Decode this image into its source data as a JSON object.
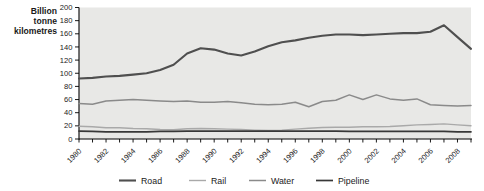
{
  "y_axis_title_lines": [
    "Billion",
    "tonne",
    "kilometres"
  ],
  "chart_data": {
    "type": "line",
    "title": "",
    "ylabel": "Billion tonne kilometres",
    "xlabel": "",
    "x": [
      1980,
      1981,
      1982,
      1983,
      1984,
      1985,
      1986,
      1987,
      1988,
      1989,
      1990,
      1991,
      1992,
      1993,
      1994,
      1995,
      1996,
      1997,
      1998,
      1999,
      2000,
      2001,
      2002,
      2003,
      2004,
      2005,
      2006,
      2007,
      2008,
      2009
    ],
    "x_labeled_ticks": [
      1980,
      1982,
      1984,
      1986,
      1988,
      1990,
      1992,
      1994,
      1996,
      1998,
      2000,
      2002,
      2004,
      2006,
      2008
    ],
    "ylim": [
      0,
      200
    ],
    "ytick_step": 20,
    "grid": false,
    "legend_position": "bottom",
    "plot_bg_color": "#e8e8e6",
    "axis_color": "#000000",
    "label_color": "#1a1a1a",
    "series": [
      {
        "name": "Road",
        "color": "#4f4f4f",
        "stroke_width": 2.1,
        "values": [
          92,
          93,
          95,
          96,
          98,
          100,
          105,
          113,
          130,
          138,
          136,
          130,
          127,
          133,
          141,
          147,
          150,
          154,
          157,
          159,
          159,
          158,
          159,
          160,
          161,
          161,
          163,
          173,
          155,
          137
        ]
      },
      {
        "name": "Rail",
        "color": "#a9a9a9",
        "stroke_width": 1.4,
        "values": [
          19.5,
          18.5,
          17,
          17,
          16,
          15.5,
          14.5,
          14,
          15.5,
          16,
          15.5,
          15,
          14.5,
          13.5,
          13,
          13.5,
          15,
          16.5,
          17.5,
          18,
          18,
          18.5,
          18.5,
          19,
          20,
          21.5,
          22,
          23,
          21.5,
          20
        ]
      },
      {
        "name": "Water",
        "color": "#8a8a8a",
        "stroke_width": 1.5,
        "values": [
          54,
          53,
          58,
          59,
          60,
          59,
          58,
          57,
          58,
          56,
          56,
          57,
          55,
          53,
          52,
          53,
          56,
          49,
          57,
          59,
          67,
          60,
          67,
          61,
          59,
          61,
          52,
          51,
          50,
          51
        ]
      },
      {
        "name": "Pipeline",
        "color": "#383838",
        "stroke_width": 1.7,
        "values": [
          12,
          11.5,
          11,
          11,
          11,
          11,
          11.5,
          11.5,
          12,
          12,
          12,
          12,
          12,
          12,
          12,
          12,
          12,
          12,
          12,
          12,
          11.5,
          11.5,
          11.5,
          11.5,
          11.5,
          11.5,
          11.5,
          11.5,
          11,
          11
        ]
      }
    ],
    "legend_x_starts": [
      119,
      189,
      249,
      316
    ]
  }
}
